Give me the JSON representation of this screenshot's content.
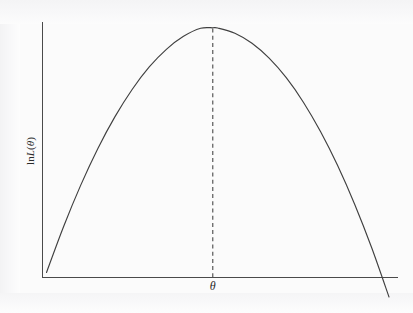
{
  "chart_data": {
    "type": "line",
    "title": "",
    "subtitle": "",
    "xlabel": "θ",
    "ylabel": "ln L(θ)",
    "ylabel_parts": {
      "function_prefix": "ln",
      "function_name": "L",
      "open_paren": "(",
      "argument": "θ",
      "close_paren": ")"
    },
    "grid": false,
    "legend": null,
    "legend_position": "none",
    "x_tick_labels": [],
    "y_tick_labels": [],
    "x_ticks_visible": false,
    "y_ticks_visible": false,
    "xlim": [
      0,
      1
    ],
    "ylim": [
      0,
      1
    ],
    "series": [
      {
        "name": "log-likelihood",
        "style": "solid",
        "color": "#404040",
        "shape": "concave-parabola",
        "x": [
          0.0,
          0.05,
          0.1,
          0.15,
          0.2,
          0.25,
          0.3,
          0.35,
          0.4,
          0.45,
          0.4855,
          0.5,
          0.55,
          0.6,
          0.65,
          0.7,
          0.75,
          0.8,
          0.85,
          0.9,
          0.95,
          1.0
        ],
        "y": [
          0.0,
          0.188,
          0.357,
          0.507,
          0.637,
          0.748,
          0.84,
          0.912,
          0.965,
          0.998,
          1.0,
          0.999,
          0.978,
          0.937,
          0.876,
          0.796,
          0.696,
          0.576,
          0.437,
          0.278,
          0.099,
          -0.1
        ]
      }
    ],
    "annotations": [
      {
        "name": "mle-vertical-line",
        "type": "vertical-dashed-line",
        "x": 0.4855,
        "y_from": 0.0,
        "y_to": 1.0,
        "style": "dashed",
        "color": "#4a4a4a",
        "label": ""
      },
      {
        "name": "maximum-point",
        "type": "peak",
        "x": 0.4855,
        "y": 1.0,
        "label": ""
      }
    ],
    "colors": {
      "curve": "#404040",
      "axis": "#4a4a4a",
      "dashed_line": "#4a4a4a",
      "background": "#fbfbfb",
      "text": "#2b2b2b"
    }
  },
  "figure": {
    "caption": "",
    "background_color": "#fbfbfb"
  }
}
